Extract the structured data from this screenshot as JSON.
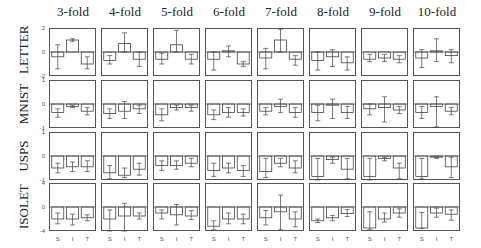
{
  "chart_data": {
    "type": "bar",
    "title": "",
    "layout": "grid 4 rows x 8 columns of small bar charts with error bars",
    "column_titles": [
      "3-fold",
      "4-fold",
      "5-fold",
      "6-fold",
      "7-fold",
      "8-fold",
      "9-fold",
      "10-fold"
    ],
    "categories": [
      "S",
      "I",
      "T"
    ],
    "grid": false,
    "rows": [
      {
        "name": "LETTER",
        "ylim": [
          -2,
          2
        ],
        "yticks": [
          "2",
          "0",
          "-2"
        ],
        "panels": [
          {
            "fold": "3-fold",
            "values": [
              -0.4,
              1.0,
              -1.0
            ],
            "err_low": [
              -1.4,
              0.9,
              -1.4
            ],
            "err_high": [
              0.6,
              1.1,
              -0.4
            ]
          },
          {
            "fold": "4-fold",
            "values": [
              -0.7,
              0.7,
              -0.6
            ],
            "err_low": [
              -1.0,
              0.0,
              -1.2
            ],
            "err_high": [
              -0.3,
              1.6,
              0.0
            ]
          },
          {
            "fold": "5-fold",
            "values": [
              -0.6,
              0.6,
              -0.6
            ],
            "err_low": [
              -1.0,
              0.0,
              -1.0
            ],
            "err_high": [
              -0.1,
              1.8,
              -0.2
            ]
          },
          {
            "fold": "6-fold",
            "values": [
              -0.6,
              0.1,
              -1.0
            ],
            "err_low": [
              -1.5,
              -0.4,
              -1.2
            ],
            "err_high": [
              0.0,
              0.5,
              -0.8
            ]
          },
          {
            "fold": "7-fold",
            "values": [
              -0.5,
              1.0,
              -0.6
            ],
            "err_low": [
              -1.4,
              0.0,
              -1.1
            ],
            "err_high": [
              0.3,
              1.9,
              -0.3
            ]
          },
          {
            "fold": "8-fold",
            "values": [
              -0.7,
              -0.4,
              -0.9
            ],
            "err_low": [
              -1.5,
              -1.2,
              -1.5
            ],
            "err_high": [
              0.0,
              0.2,
              -0.4
            ]
          },
          {
            "fold": "9-fold",
            "values": [
              -0.6,
              -0.5,
              -0.6
            ],
            "err_low": [
              -0.8,
              -0.8,
              -0.9
            ],
            "err_high": [
              -0.2,
              -0.2,
              -0.3
            ]
          },
          {
            "fold": "10-fold",
            "values": [
              -0.5,
              0.1,
              -0.3
            ],
            "err_low": [
              -1.3,
              -0.8,
              -0.9
            ],
            "err_high": [
              0.2,
              1.1,
              0.2
            ]
          }
        ]
      },
      {
        "name": "MNIST",
        "ylim": [
          -1,
          1
        ],
        "yticks": [
          "1",
          "0",
          "-1"
        ],
        "panels": [
          {
            "fold": "3-fold",
            "values": [
              -0.35,
              -0.1,
              -0.3
            ],
            "err_low": [
              -0.55,
              -0.15,
              -0.45
            ],
            "err_high": [
              -0.2,
              -0.05,
              -0.15
            ]
          },
          {
            "fold": "4-fold",
            "values": [
              -0.4,
              -0.3,
              -0.2
            ],
            "err_low": [
              -0.6,
              -0.6,
              -0.4
            ],
            "err_high": [
              -0.2,
              0.1,
              -0.05
            ]
          },
          {
            "fold": "5-fold",
            "values": [
              -0.45,
              -0.15,
              -0.15
            ],
            "err_low": [
              -0.7,
              -0.25,
              -0.3
            ],
            "err_high": [
              -0.2,
              -0.05,
              -0.05
            ]
          },
          {
            "fold": "6-fold",
            "values": [
              -0.45,
              -0.35,
              -0.35
            ],
            "err_low": [
              -0.65,
              -0.55,
              -0.5
            ],
            "err_high": [
              -0.25,
              -0.15,
              -0.2
            ]
          },
          {
            "fold": "7-fold",
            "values": [
              -0.3,
              -0.1,
              -0.35
            ],
            "err_low": [
              -0.45,
              -0.35,
              -0.55
            ],
            "err_high": [
              -0.15,
              0.2,
              -0.15
            ]
          },
          {
            "fold": "8-fold",
            "values": [
              -0.35,
              -0.05,
              -0.35
            ],
            "err_low": [
              -0.7,
              -0.6,
              -0.6
            ],
            "err_high": [
              -0.05,
              0.2,
              -0.1
            ]
          },
          {
            "fold": "9-fold",
            "values": [
              -0.2,
              -0.15,
              -0.25
            ],
            "err_low": [
              -0.45,
              -0.75,
              -0.4
            ],
            "err_high": [
              0.0,
              0.3,
              -0.1
            ]
          },
          {
            "fold": "10-fold",
            "values": [
              -0.35,
              -0.1,
              -0.3
            ],
            "err_low": [
              -0.6,
              -0.95,
              -0.45
            ],
            "err_high": [
              -0.1,
              0.3,
              -0.15
            ]
          }
        ]
      },
      {
        "name": "USPS",
        "ylim": [
          -1,
          1
        ],
        "yticks": [
          "1",
          "0",
          "-1"
        ],
        "panels": [
          {
            "fold": "3-fold",
            "values": [
              -0.5,
              -0.45,
              -0.45
            ],
            "err_low": [
              -0.7,
              -0.65,
              -0.65
            ],
            "err_high": [
              -0.3,
              -0.25,
              -0.2
            ]
          },
          {
            "fold": "4-fold",
            "values": [
              -0.7,
              -0.8,
              -0.55
            ],
            "err_low": [
              -0.95,
              -0.9,
              -0.8
            ],
            "err_high": [
              -0.4,
              -0.5,
              -0.3
            ]
          },
          {
            "fold": "5-fold",
            "values": [
              -0.4,
              -0.4,
              -0.3
            ],
            "err_low": [
              -0.6,
              -0.55,
              -0.45
            ],
            "err_high": [
              -0.2,
              -0.2,
              -0.1
            ]
          },
          {
            "fold": "6-fold",
            "values": [
              -0.6,
              -0.5,
              -0.6
            ],
            "err_low": [
              -0.85,
              -0.7,
              -0.85
            ],
            "err_high": [
              -0.3,
              -0.3,
              -0.4
            ]
          },
          {
            "fold": "7-fold",
            "values": [
              -0.65,
              -0.3,
              -0.5
            ],
            "err_low": [
              -0.9,
              -0.45,
              -0.7
            ],
            "err_high": [
              -0.1,
              -0.1,
              -0.2
            ]
          },
          {
            "fold": "8-fold",
            "values": [
              -0.85,
              -0.15,
              -0.55
            ],
            "err_low": [
              -1.0,
              -0.3,
              -0.95
            ],
            "err_high": [
              -0.1,
              -0.05,
              -0.1
            ]
          },
          {
            "fold": "9-fold",
            "values": [
              -0.85,
              -0.1,
              -0.5
            ],
            "err_low": [
              -1.0,
              -0.2,
              -0.95
            ],
            "err_high": [
              -0.1,
              -0.05,
              -0.3
            ]
          },
          {
            "fold": "10-fold",
            "values": [
              -0.85,
              -0.05,
              -0.45
            ],
            "err_low": [
              -0.95,
              -0.1,
              -0.9
            ],
            "err_high": [
              -0.1,
              -0.03,
              -0.05
            ]
          }
        ]
      },
      {
        "name": "ISOLET",
        "ylim": [
          -4,
          4
        ],
        "yticks": [
          "4",
          "0",
          "-4"
        ],
        "panels": [
          {
            "fold": "3-fold",
            "values": [
              -2.0,
              -2.0,
              -1.8
            ],
            "err_low": [
              -2.8,
              -3.0,
              -2.3
            ],
            "err_high": [
              -1.0,
              -1.2,
              -1.3
            ]
          },
          {
            "fold": "4-fold",
            "values": [
              -2.0,
              -1.5,
              -1.5
            ],
            "err_low": [
              -4.0,
              -4.0,
              -2.0
            ],
            "err_high": [
              -0.5,
              0.6,
              -1.0
            ]
          },
          {
            "fold": "5-fold",
            "values": [
              -1.0,
              -1.3,
              -1.5
            ],
            "err_low": [
              -2.0,
              -3.0,
              -2.1
            ],
            "err_high": [
              -0.5,
              0.4,
              -0.6
            ]
          },
          {
            "fold": "6-fold",
            "values": [
              -3.2,
              -2.0,
              -2.0
            ],
            "err_low": [
              -3.8,
              -2.8,
              -2.8
            ],
            "err_high": [
              -2.3,
              -1.0,
              -1.2
            ]
          },
          {
            "fold": "7-fold",
            "values": [
              -1.8,
              -0.8,
              -2.0
            ],
            "err_low": [
              -3.0,
              -3.8,
              -3.3
            ],
            "err_high": [
              -0.6,
              2.0,
              -0.8
            ]
          },
          {
            "fold": "8-fold",
            "values": [
              -2.3,
              -1.8,
              -1.1
            ],
            "err_low": [
              -2.6,
              -2.3,
              -1.6
            ],
            "err_high": [
              -2.0,
              -1.4,
              -0.4
            ]
          },
          {
            "fold": "9-fold",
            "values": [
              -3.5,
              -2.0,
              -1.0
            ],
            "err_low": [
              -3.8,
              -2.5,
              -1.7
            ],
            "err_high": [
              -0.8,
              -1.0,
              -0.3
            ]
          },
          {
            "fold": "10-fold",
            "values": [
              -3.5,
              -1.0,
              -1.2
            ],
            "err_low": [
              -3.6,
              -1.7,
              -2.2
            ],
            "err_high": [
              -0.9,
              -0.2,
              -0.5
            ]
          }
        ]
      }
    ],
    "colors": {
      "frame": "#555555",
      "bar": "#444444",
      "errorbar": "#444444"
    }
  }
}
